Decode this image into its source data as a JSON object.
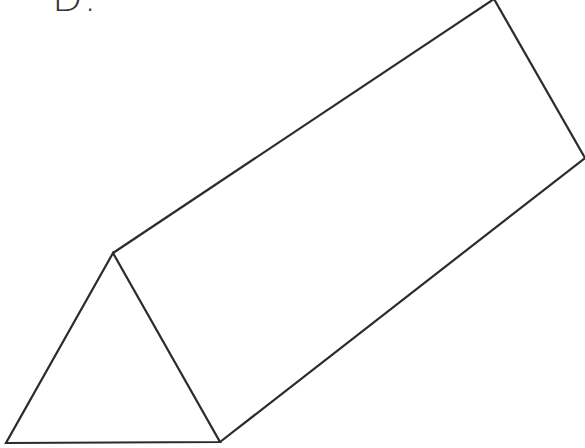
{
  "figure": {
    "label": "D.",
    "shape": "triangular-prism",
    "stroke_color": "#2b2b2b",
    "stroke_width": 2.2,
    "vertices": {
      "front_top": [
        113,
        253
      ],
      "front_left": [
        6,
        443
      ],
      "front_right": [
        220,
        442
      ],
      "back_top": [
        494,
        0
      ],
      "back_right": [
        585,
        158
      ]
    }
  }
}
